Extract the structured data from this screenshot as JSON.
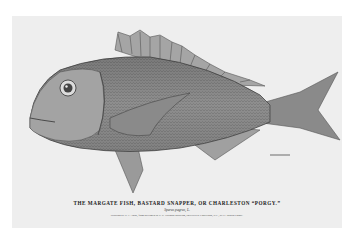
{
  "plate": {
    "title": "THE MARGATE FISH, BASTARD SNAPPER, OR CHARLESTON “PORGY.”",
    "scientific_name": "Sparus pagrus, L.",
    "credit": "Drawing by H. L. Todd, from specimen in U. S. National Museum, collected at Charleston, S.C., by G. Brown Goode."
  },
  "colors": {
    "background": "#ffffff",
    "plate": "#eeeeee",
    "ink": "#555555"
  }
}
